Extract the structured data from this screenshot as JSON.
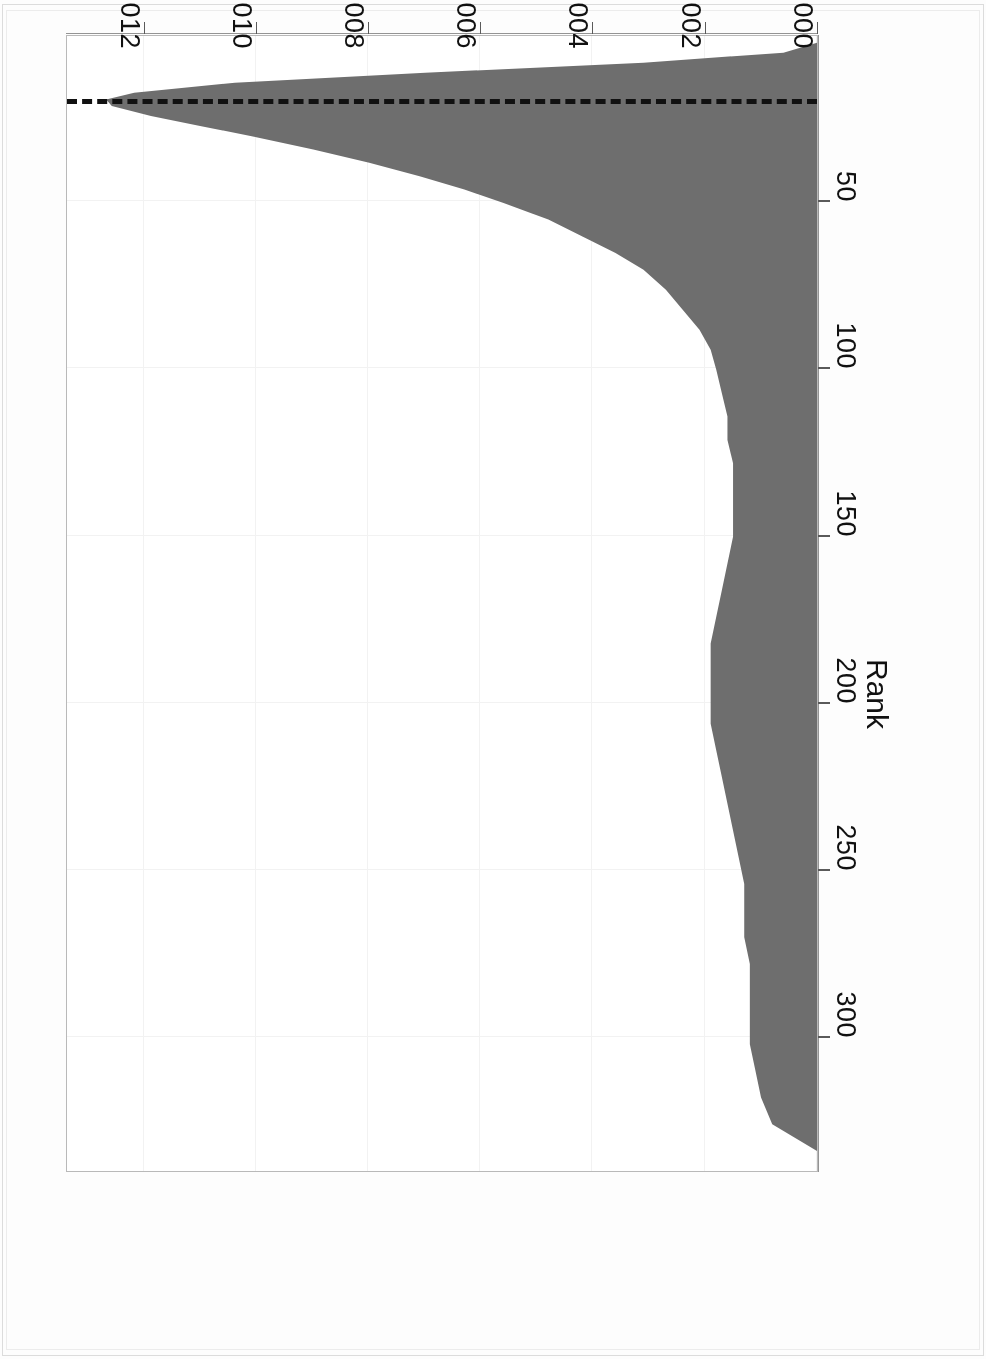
{
  "figure": {
    "rotation_degrees": 180,
    "background": "#ffffff",
    "fill_color": "#6e6e6e",
    "axis_color": "#5a5a5a",
    "grid_color": "#f2f2f2",
    "refline_color": "#111111"
  },
  "chart_data": {
    "type": "area",
    "title": "",
    "xlabel": "Rank",
    "ylabel": "density",
    "orientation": "rotated-180",
    "grid": true,
    "legend": null,
    "xlim": [
      0,
      340
    ],
    "ylim": [
      0,
      0.0134
    ],
    "xticks": [
      50,
      100,
      150,
      200,
      250,
      300
    ],
    "xticklabels": [
      "50",
      "100",
      "150",
      "200",
      "250",
      "300"
    ],
    "yticks": [
      0.0,
      0.002,
      0.004,
      0.006,
      0.008,
      0.01,
      0.012
    ],
    "yticklabels": [
      "0.000",
      "0.002",
      "0.004",
      "0.006",
      "0.008",
      "0.010",
      "0.012"
    ],
    "annotations": [
      {
        "type": "vline",
        "value": 21,
        "style": "dashed",
        "axis": "Rank",
        "label": ""
      }
    ],
    "series": [
      {
        "name": "density",
        "x": [
          2,
          5,
          8,
          11,
          14,
          17,
          19,
          21,
          24,
          27,
          30,
          34,
          38,
          42,
          46,
          50,
          55,
          60,
          65,
          70,
          76,
          82,
          88,
          94,
          100,
          107,
          114,
          121,
          128,
          135,
          142,
          150,
          158,
          166,
          174,
          182,
          190,
          198,
          206,
          214,
          222,
          230,
          238,
          246,
          254,
          262,
          270,
          278,
          286,
          294,
          302,
          310,
          318,
          326,
          334
        ],
        "y": [
          0.0,
          0.0006,
          0.0031,
          0.007,
          0.0104,
          0.0122,
          0.0127,
          0.0126,
          0.0119,
          0.011,
          0.0101,
          0.009,
          0.008,
          0.0071,
          0.0063,
          0.0056,
          0.0048,
          0.0042,
          0.0036,
          0.0031,
          0.0027,
          0.0024,
          0.0021,
          0.0019,
          0.0018,
          0.0017,
          0.0016,
          0.0016,
          0.0015,
          0.0015,
          0.0015,
          0.0015,
          0.0016,
          0.0017,
          0.0018,
          0.0019,
          0.0019,
          0.0019,
          0.0019,
          0.0018,
          0.0017,
          0.0016,
          0.0015,
          0.0014,
          0.0013,
          0.0013,
          0.0013,
          0.0012,
          0.0012,
          0.0012,
          0.0012,
          0.0011,
          0.001,
          0.0008,
          0.0
        ]
      }
    ]
  }
}
